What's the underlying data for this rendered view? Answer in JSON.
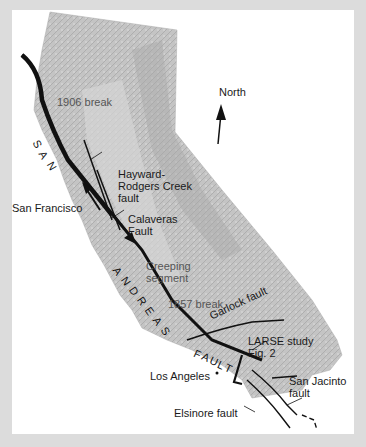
{
  "map": {
    "title": "San Andreas Fault system, California",
    "compass": {
      "label": "North",
      "icon": "north-arrow-icon"
    },
    "labels": {
      "break_1906": "1906 break",
      "break_1857": "1857 break",
      "san": "SAN",
      "andreas": "ANDREAS",
      "fault": "FAULT",
      "hayward": "Hayward-\nRodgers Creek\nfault",
      "hayward_l1": "Hayward-",
      "hayward_l2": "Rodgers Creek",
      "hayward_l3": "fault",
      "calaveras_l1": "Calaveras",
      "calaveras_l2": "Fault",
      "san_francisco": "San Francisco",
      "creeping_l1": "Creeping",
      "creeping_l2": "segment",
      "garlock": "Garlock fault",
      "larse_l1": "LARSE study",
      "larse_l2": "Fig. 2",
      "los_angeles": "Los Angeles",
      "san_jacinto_l1": "San Jacinto",
      "san_jacinto_l2": "fault",
      "elsinore": "Elsinore fault"
    },
    "colors": {
      "background_border": "#dcdcdc",
      "panel": "#ffffff",
      "terrain": "#bdbdbd",
      "terrain_dark": "#9e9e9e",
      "fault_line": "#111111",
      "label_text": "#1a1a1a",
      "muted_label": "#555555"
    }
  }
}
